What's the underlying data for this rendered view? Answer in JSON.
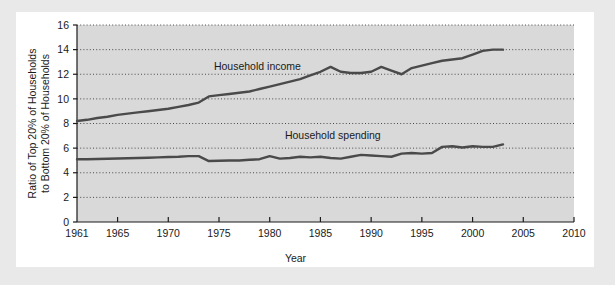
{
  "chart_data": {
    "type": "line",
    "title": "",
    "xlabel": "Year",
    "ylabel": "Ratio of Top 20% of Households to Bottom 20% of Households",
    "ylabel_line1": "Ratio of Top 20% of Households",
    "ylabel_line2": "to Bottom 20% of Households",
    "xlim": [
      1961,
      2010
    ],
    "ylim": [
      0,
      16
    ],
    "xticks": [
      1961,
      1965,
      1970,
      1975,
      1980,
      1985,
      1990,
      1995,
      2000,
      2005,
      2010
    ],
    "xtick_labels": [
      "1961",
      "1965",
      "1970",
      "1975",
      "1980",
      "1985",
      "1990",
      "1995",
      "2000",
      "2005",
      "2010"
    ],
    "yticks": [
      0,
      2,
      4,
      6,
      8,
      10,
      12,
      14,
      16
    ],
    "ytick_labels": [
      "0",
      "2",
      "4",
      "6",
      "8",
      "10",
      "12",
      "14",
      "16"
    ],
    "grid": "horizontal-dotted",
    "legend_position": "inline-annotation",
    "plot_bg_color": "#d9d9d9",
    "line_color": "#4a4a4a",
    "series": [
      {
        "name": "Household income",
        "label": "Household income",
        "x": [
          1961,
          1962,
          1963,
          1964,
          1965,
          1966,
          1967,
          1968,
          1969,
          1970,
          1971,
          1972,
          1973,
          1974,
          1975,
          1976,
          1977,
          1978,
          1979,
          1980,
          1981,
          1982,
          1983,
          1984,
          1985,
          1986,
          1987,
          1988,
          1989,
          1990,
          1991,
          1992,
          1993,
          1994,
          1995,
          1996,
          1997,
          1998,
          1999,
          2000,
          2001,
          2002,
          2003
        ],
        "values": [
          8.2,
          8.3,
          8.45,
          8.55,
          8.7,
          8.8,
          8.9,
          9.0,
          9.1,
          9.2,
          9.35,
          9.5,
          9.7,
          10.2,
          10.3,
          10.4,
          10.5,
          10.6,
          10.8,
          11.0,
          11.2,
          11.4,
          11.6,
          11.9,
          12.2,
          12.6,
          12.2,
          12.1,
          12.1,
          12.2,
          12.6,
          12.3,
          12.0,
          12.5,
          12.7,
          12.9,
          13.1,
          13.2,
          13.3,
          13.6,
          13.9,
          14.0,
          14.0
        ]
      },
      {
        "name": "Household spending",
        "label": "Household spending",
        "x": [
          1961,
          1962,
          1963,
          1964,
          1965,
          1966,
          1967,
          1968,
          1969,
          1970,
          1971,
          1972,
          1973,
          1974,
          1975,
          1976,
          1977,
          1978,
          1979,
          1980,
          1981,
          1982,
          1983,
          1984,
          1985,
          1986,
          1987,
          1988,
          1989,
          1990,
          1991,
          1992,
          1993,
          1994,
          1995,
          1996,
          1997,
          1998,
          1999,
          2000,
          2001,
          2002,
          2003
        ],
        "values": [
          5.1,
          5.1,
          5.12,
          5.14,
          5.16,
          5.18,
          5.2,
          5.22,
          5.25,
          5.28,
          5.3,
          5.35,
          5.35,
          4.95,
          4.98,
          5.0,
          5.0,
          5.05,
          5.1,
          5.35,
          5.15,
          5.2,
          5.3,
          5.25,
          5.3,
          5.2,
          5.15,
          5.3,
          5.45,
          5.4,
          5.35,
          5.3,
          5.55,
          5.6,
          5.55,
          5.6,
          6.1,
          6.15,
          6.05,
          6.15,
          6.1,
          6.1,
          6.3
        ]
      }
    ]
  }
}
